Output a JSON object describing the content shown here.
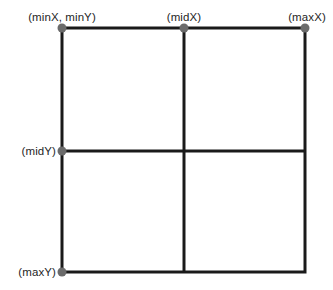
{
  "diagram": {
    "background_color": "#ffffff",
    "line_color": "#1a1a1a",
    "node_color": "#6b6b6b",
    "text_color": "#1f1f1f",
    "line_width": 3,
    "node_radius": 4.5,
    "bounds": {
      "left": 62,
      "right": 305,
      "top": 28,
      "bottom": 272,
      "mid_x": 184,
      "mid_y": 151
    },
    "labels": {
      "min_corner": "(minX, minY)",
      "mid_x": "(midX)",
      "max_x": "(maxX)",
      "mid_y": "(midY)",
      "max_y": "(maxY)"
    },
    "nodes": [
      {
        "name": "min-corner",
        "x": 62,
        "y": 28
      },
      {
        "name": "mid-x",
        "x": 184,
        "y": 28
      },
      {
        "name": "max-x",
        "x": 305,
        "y": 28
      },
      {
        "name": "mid-y",
        "x": 62,
        "y": 151
      },
      {
        "name": "max-y",
        "x": 62,
        "y": 272
      }
    ],
    "label_positions": {
      "min_corner": {
        "x": 62,
        "y": 24
      },
      "mid_x": {
        "x": 184,
        "y": 24
      },
      "max_x": {
        "x": 307,
        "y": 24
      },
      "mid_y": {
        "x": 56,
        "y": 151
      },
      "max_y": {
        "x": 56,
        "y": 272
      }
    }
  }
}
